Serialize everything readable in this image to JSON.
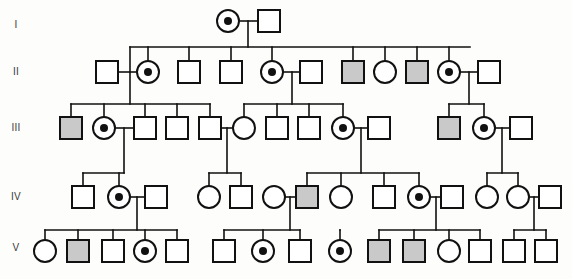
{
  "figure": {
    "type": "pedigree",
    "generations": [
      "I",
      "II",
      "III",
      "IV",
      "V"
    ],
    "symbol_size": 22,
    "colors": {
      "line": "#111111",
      "affected_fill": "#c9c9c9",
      "unaffected_fill": "#ffffff",
      "carrier_dot": "#111111",
      "background": "#fdfdfb",
      "label": "#3a3a3a"
    },
    "legend_semantics": {
      "square": "male",
      "circle": "female",
      "shaded": "affected",
      "dot-center": "carrier"
    }
  },
  "generation_labels": [
    {
      "text": "I",
      "x": 16,
      "y": 28
    },
    {
      "text": "II",
      "x": 16,
      "y": 75
    },
    {
      "text": "III",
      "x": 16,
      "y": 131
    },
    {
      "text": "IV",
      "x": 16,
      "y": 200
    },
    {
      "text": "V",
      "x": 16,
      "y": 251
    }
  ],
  "individuals": [
    {
      "id": "I-1",
      "gen": "I",
      "shape": "circle",
      "state": "carrier",
      "cx": 228,
      "cy": 21
    },
    {
      "id": "I-2",
      "gen": "I",
      "shape": "square",
      "state": "unaffected",
      "cx": 269,
      "cy": 21
    },
    {
      "id": "II-1",
      "gen": "II",
      "shape": "square",
      "state": "unaffected",
      "cx": 107,
      "cy": 72
    },
    {
      "id": "II-2",
      "gen": "II",
      "shape": "circle",
      "state": "carrier",
      "cx": 148,
      "cy": 72
    },
    {
      "id": "II-3",
      "gen": "II",
      "shape": "square",
      "state": "unaffected",
      "cx": 189,
      "cy": 72
    },
    {
      "id": "II-4",
      "gen": "II",
      "shape": "square",
      "state": "unaffected",
      "cx": 231,
      "cy": 72
    },
    {
      "id": "II-5",
      "gen": "II",
      "shape": "circle",
      "state": "carrier",
      "cx": 272,
      "cy": 72
    },
    {
      "id": "II-6",
      "gen": "II",
      "shape": "square",
      "state": "unaffected",
      "cx": 311,
      "cy": 72
    },
    {
      "id": "II-7",
      "gen": "II",
      "shape": "square",
      "state": "affected",
      "cx": 353,
      "cy": 72
    },
    {
      "id": "II-8",
      "gen": "II",
      "shape": "circle",
      "state": "unaffected",
      "cx": 385,
      "cy": 72
    },
    {
      "id": "II-9",
      "gen": "II",
      "shape": "square",
      "state": "affected",
      "cx": 417,
      "cy": 72
    },
    {
      "id": "II-10",
      "gen": "II",
      "shape": "circle",
      "state": "carrier",
      "cx": 449,
      "cy": 72
    },
    {
      "id": "II-11",
      "gen": "II",
      "shape": "square",
      "state": "unaffected",
      "cx": 489,
      "cy": 72
    },
    {
      "id": "III-1",
      "gen": "III",
      "shape": "square",
      "state": "affected",
      "cx": 71,
      "cy": 128
    },
    {
      "id": "III-2",
      "gen": "III",
      "shape": "circle",
      "state": "carrier",
      "cx": 104,
      "cy": 128
    },
    {
      "id": "III-3",
      "gen": "III",
      "shape": "square",
      "state": "unaffected",
      "cx": 145,
      "cy": 128
    },
    {
      "id": "III-4",
      "gen": "III",
      "shape": "square",
      "state": "unaffected",
      "cx": 177,
      "cy": 128
    },
    {
      "id": "III-5",
      "gen": "III",
      "shape": "square",
      "state": "unaffected",
      "cx": 210,
      "cy": 128
    },
    {
      "id": "III-6",
      "gen": "III",
      "shape": "circle",
      "state": "unaffected",
      "cx": 244,
      "cy": 128
    },
    {
      "id": "III-7",
      "gen": "III",
      "shape": "square",
      "state": "unaffected",
      "cx": 277,
      "cy": 128
    },
    {
      "id": "III-8",
      "gen": "III",
      "shape": "square",
      "state": "unaffected",
      "cx": 309,
      "cy": 128
    },
    {
      "id": "III-9",
      "gen": "III",
      "shape": "circle",
      "state": "carrier",
      "cx": 343,
      "cy": 128
    },
    {
      "id": "III-10",
      "gen": "III",
      "shape": "square",
      "state": "unaffected",
      "cx": 379,
      "cy": 128
    },
    {
      "id": "III-11",
      "gen": "III",
      "shape": "square",
      "state": "affected",
      "cx": 449,
      "cy": 128
    },
    {
      "id": "III-12",
      "gen": "III",
      "shape": "circle",
      "state": "carrier",
      "cx": 484,
      "cy": 128
    },
    {
      "id": "III-13",
      "gen": "III",
      "shape": "square",
      "state": "unaffected",
      "cx": 521,
      "cy": 128
    },
    {
      "id": "IV-1",
      "gen": "IV",
      "shape": "square",
      "state": "unaffected",
      "cx": 83,
      "cy": 197
    },
    {
      "id": "IV-2",
      "gen": "IV",
      "shape": "circle",
      "state": "carrier",
      "cx": 119,
      "cy": 197
    },
    {
      "id": "IV-3",
      "gen": "IV",
      "shape": "square",
      "state": "unaffected",
      "cx": 156,
      "cy": 197
    },
    {
      "id": "IV-4",
      "gen": "IV",
      "shape": "circle",
      "state": "unaffected",
      "cx": 209,
      "cy": 197
    },
    {
      "id": "IV-5",
      "gen": "IV",
      "shape": "square",
      "state": "unaffected",
      "cx": 241,
      "cy": 197
    },
    {
      "id": "IV-6",
      "gen": "IV",
      "shape": "circle",
      "state": "unaffected",
      "cx": 274,
      "cy": 197
    },
    {
      "id": "IV-7",
      "gen": "IV",
      "shape": "square",
      "state": "affected",
      "cx": 307,
      "cy": 197
    },
    {
      "id": "IV-8",
      "gen": "IV",
      "shape": "circle",
      "state": "unaffected",
      "cx": 341,
      "cy": 197
    },
    {
      "id": "IV-9",
      "gen": "IV",
      "shape": "square",
      "state": "unaffected",
      "cx": 384,
      "cy": 197
    },
    {
      "id": "IV-10",
      "gen": "IV",
      "shape": "circle",
      "state": "carrier",
      "cx": 419,
      "cy": 197
    },
    {
      "id": "IV-11",
      "gen": "IV",
      "shape": "square",
      "state": "unaffected",
      "cx": 452,
      "cy": 197
    },
    {
      "id": "IV-12",
      "gen": "IV",
      "shape": "circle",
      "state": "unaffected",
      "cx": 487,
      "cy": 197
    },
    {
      "id": "IV-13",
      "gen": "IV",
      "shape": "circle",
      "state": "unaffected",
      "cx": 518,
      "cy": 197
    },
    {
      "id": "IV-14",
      "gen": "IV",
      "shape": "square",
      "state": "unaffected",
      "cx": 550,
      "cy": 197
    },
    {
      "id": "V-1",
      "gen": "V",
      "shape": "circle",
      "state": "unaffected",
      "cx": 45,
      "cy": 251
    },
    {
      "id": "V-2",
      "gen": "V",
      "shape": "square",
      "state": "affected",
      "cx": 78,
      "cy": 251
    },
    {
      "id": "V-3",
      "gen": "V",
      "shape": "square",
      "state": "unaffected",
      "cx": 113,
      "cy": 251
    },
    {
      "id": "V-4",
      "gen": "V",
      "shape": "circle",
      "state": "carrier",
      "cx": 145,
      "cy": 251
    },
    {
      "id": "V-5",
      "gen": "V",
      "shape": "square",
      "state": "unaffected",
      "cx": 177,
      "cy": 251
    },
    {
      "id": "V-6",
      "gen": "V",
      "shape": "square",
      "state": "unaffected",
      "cx": 224,
      "cy": 251
    },
    {
      "id": "V-7",
      "gen": "V",
      "shape": "circle",
      "state": "carrier",
      "cx": 263,
      "cy": 251
    },
    {
      "id": "V-8",
      "gen": "V",
      "shape": "square",
      "state": "unaffected",
      "cx": 300,
      "cy": 251
    },
    {
      "id": "V-9",
      "gen": "V",
      "shape": "circle",
      "state": "carrier",
      "cx": 340,
      "cy": 251
    },
    {
      "id": "V-10",
      "gen": "V",
      "shape": "square",
      "state": "affected",
      "cx": 379,
      "cy": 251
    },
    {
      "id": "V-11",
      "gen": "V",
      "shape": "square",
      "state": "affected",
      "cx": 414,
      "cy": 251
    },
    {
      "id": "V-12",
      "gen": "V",
      "shape": "circle",
      "state": "unaffected",
      "cx": 449,
      "cy": 251
    },
    {
      "id": "V-13",
      "gen": "V",
      "shape": "square",
      "state": "unaffected",
      "cx": 480,
      "cy": 251
    },
    {
      "id": "V-14",
      "gen": "V",
      "shape": "square",
      "state": "unaffected",
      "cx": 514,
      "cy": 251
    },
    {
      "id": "V-15",
      "gen": "V",
      "shape": "square",
      "state": "unaffected",
      "cx": 546,
      "cy": 251
    }
  ],
  "connectors": [
    {
      "name": "mating-I1-I2",
      "d": "M 240 21 L 257 21"
    },
    {
      "name": "sibship-drop-I",
      "d": "M 248 21 L 248 47"
    },
    {
      "name": "sibship-bar-II",
      "d": "M 130 47 L 470 47"
    },
    {
      "name": "stub-II-2",
      "d": "M 148 47 L 148 61"
    },
    {
      "name": "stub-II-3",
      "d": "M 189 47 L 189 61"
    },
    {
      "name": "stub-II-4",
      "d": "M 231 47 L 231 61"
    },
    {
      "name": "stub-II-5",
      "d": "M 272 47 L 272 61"
    },
    {
      "name": "stub-II-7",
      "d": "M 353 47 L 353 61"
    },
    {
      "name": "stub-II-8",
      "d": "M 385 47 L 385 61"
    },
    {
      "name": "stub-II-9",
      "d": "M 417 47 L 417 61"
    },
    {
      "name": "stub-II-10",
      "d": "M 449 47 L 449 61"
    },
    {
      "name": "left-branch-down",
      "d": "M 130 47 L 130 72"
    },
    {
      "name": "mating-II1-II2",
      "d": "M 118 72 L 137 72"
    },
    {
      "name": "drop-II1-II2",
      "d": "M 130 72 L 130 104"
    },
    {
      "name": "sibship-bar-III-a",
      "d": "M 71 104 L 210 104"
    },
    {
      "name": "stub-III-1",
      "d": "M 71 104 L 71 117"
    },
    {
      "name": "stub-III-2",
      "d": "M 104 104 L 104 117"
    },
    {
      "name": "stub-III-3",
      "d": "M 145 104 L 145 117"
    },
    {
      "name": "stub-III-4",
      "d": "M 177 104 L 177 117"
    },
    {
      "name": "stub-III-5",
      "d": "M 210 104 L 210 117"
    },
    {
      "name": "mating-II5-II6",
      "d": "M 283 72 L 300 72"
    },
    {
      "name": "drop-II5-II6",
      "d": "M 292 72 L 292 104"
    },
    {
      "name": "sibship-bar-III-b",
      "d": "M 244 104 L 343 104"
    },
    {
      "name": "stub-III-6",
      "d": "M 244 104 L 244 117"
    },
    {
      "name": "stub-III-7",
      "d": "M 277 104 L 277 117"
    },
    {
      "name": "stub-III-8",
      "d": "M 309 104 L 309 117"
    },
    {
      "name": "stub-III-9",
      "d": "M 343 104 L 343 117"
    },
    {
      "name": "mating-II10-II11",
      "d": "M 460 72 L 478 72"
    },
    {
      "name": "drop-II10-II11",
      "d": "M 469 72 L 469 104"
    },
    {
      "name": "sibship-bar-III-c",
      "d": "M 449 104 L 484 104"
    },
    {
      "name": "stub-III-11",
      "d": "M 449 104 L 449 117"
    },
    {
      "name": "stub-III-12",
      "d": "M 484 104 L 484 117"
    },
    {
      "name": "mating-III2-III3",
      "d": "M 115 128 L 134 128"
    },
    {
      "name": "drop-III2-III3",
      "d": "M 124 128 L 124 173"
    },
    {
      "name": "sibship-bar-IV-a",
      "d": "M 83 173 L 124 173"
    },
    {
      "name": "stub-IV-1",
      "d": "M 83 173 L 83 186"
    },
    {
      "name": "stub-IV-2",
      "d": "M 119 173 L 119 186"
    },
    {
      "name": "mating-III5-III6",
      "d": "M 221 128 L 233 128"
    },
    {
      "name": "drop-III5-III6",
      "d": "M 227 128 L 227 173"
    },
    {
      "name": "sibship-bar-IV-b",
      "d": "M 209 173 L 241 173"
    },
    {
      "name": "stub-IV-4",
      "d": "M 209 173 L 209 186"
    },
    {
      "name": "stub-IV-5",
      "d": "M 241 173 L 241 186"
    },
    {
      "name": "mating-III9-III10",
      "d": "M 354 128 L 368 128"
    },
    {
      "name": "drop-III9-III10",
      "d": "M 361 128 L 361 173"
    },
    {
      "name": "sibship-bar-IV-c",
      "d": "M 307 173 L 419 173"
    },
    {
      "name": "stub-IV-7",
      "d": "M 307 173 L 307 186"
    },
    {
      "name": "stub-IV-8",
      "d": "M 341 173 L 341 186"
    },
    {
      "name": "stub-IV-9",
      "d": "M 384 173 L 384 186"
    },
    {
      "name": "stub-IV-10",
      "d": "M 419 173 L 419 186"
    },
    {
      "name": "mating-III12-III13",
      "d": "M 495 128 L 510 128"
    },
    {
      "name": "drop-III12-III13",
      "d": "M 502 128 L 502 173"
    },
    {
      "name": "sibship-bar-IV-d",
      "d": "M 487 173 L 518 173"
    },
    {
      "name": "stub-IV-12",
      "d": "M 487 173 L 487 186"
    },
    {
      "name": "stub-IV-13",
      "d": "M 518 173 L 518 186"
    },
    {
      "name": "mating-IV2-IV3",
      "d": "M 130 197 L 145 197"
    },
    {
      "name": "drop-IV2-IV3",
      "d": "M 137 197 L 137 230"
    },
    {
      "name": "sibship-bar-V-a",
      "d": "M 45 230 L 177 230"
    },
    {
      "name": "stub-V-1",
      "d": "M 45 230 L 45 240"
    },
    {
      "name": "stub-V-2",
      "d": "M 78 230 L 78 240"
    },
    {
      "name": "stub-V-3",
      "d": "M 113 230 L 113 240"
    },
    {
      "name": "stub-V-4",
      "d": "M 145 230 L 145 240"
    },
    {
      "name": "stub-V-5",
      "d": "M 177 230 L 177 240"
    },
    {
      "name": "mating-IV6-IV7",
      "d": "M 285 197 L 296 197"
    },
    {
      "name": "drop-IV6-IV7",
      "d": "M 290 197 L 290 230"
    },
    {
      "name": "sibship-bar-V-b",
      "d": "M 224 230 L 300 230"
    },
    {
      "name": "stub-V-6",
      "d": "M 224 230 L 224 240"
    },
    {
      "name": "stub-V-7",
      "d": "M 263 230 L 263 240"
    },
    {
      "name": "stub-V-8",
      "d": "M 300 230 L 300 240"
    },
    {
      "name": "mating-IV10-IV11",
      "d": "M 430 197 L 441 197"
    },
    {
      "name": "drop-IV10-IV11",
      "d": "M 436 197 L 436 230"
    },
    {
      "name": "sibship-bar-V-c",
      "d": "M 379 230 L 480 230"
    },
    {
      "name": "stub-V-10",
      "d": "M 379 230 L 379 240"
    },
    {
      "name": "stub-V-11",
      "d": "M 414 230 L 414 240"
    },
    {
      "name": "stub-V-12",
      "d": "M 449 230 L 449 240"
    },
    {
      "name": "stub-V-13",
      "d": "M 480 230 L 480 240"
    },
    {
      "name": "stub-V-9",
      "d": "M 340 230 L 340 240"
    },
    {
      "name": "sibship-link-V-9",
      "d": "M 340 230 L 340 230"
    },
    {
      "name": "mating-IV13-IV14",
      "d": "M 529 197 L 539 197"
    },
    {
      "name": "drop-IV13-IV14",
      "d": "M 534 197 L 534 230"
    },
    {
      "name": "sibship-bar-V-d",
      "d": "M 514 230 L 546 230"
    },
    {
      "name": "stub-V-14",
      "d": "M 514 230 L 514 240"
    },
    {
      "name": "stub-V-15",
      "d": "M 546 230 L 546 240"
    }
  ]
}
